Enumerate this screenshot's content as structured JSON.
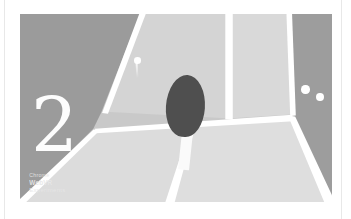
{
  "page": {
    "background_color": "#ffffff",
    "rule_color": "#e8e8e8"
  },
  "scene": {
    "name": "vr-ping-pong-court",
    "score": "2",
    "colors": {
      "wall_left": "#9b9b9b",
      "wall_right": "#9d9d9d",
      "back_wall_left": "#d4d4d4",
      "back_wall_right": "#d9d9d9",
      "floor": "#dedede",
      "seam_line": "#ffffff",
      "paddle_head": "#4f4f4f",
      "paddle_handle": "#fafafa",
      "ball": "#ffffff",
      "score_text": "#fdfdfd",
      "watermark_text": "#e7e7e7"
    },
    "objects": {
      "paddle_label": "ping-pong paddle",
      "ball_flying_label": "ball in flight",
      "ball_wall_a_label": "ball on right wall",
      "ball_wall_b_label": "ball on right wall"
    }
  },
  "watermark": {
    "brand": "WebVR",
    "sub": "Experiments",
    "top": "Chrome"
  }
}
